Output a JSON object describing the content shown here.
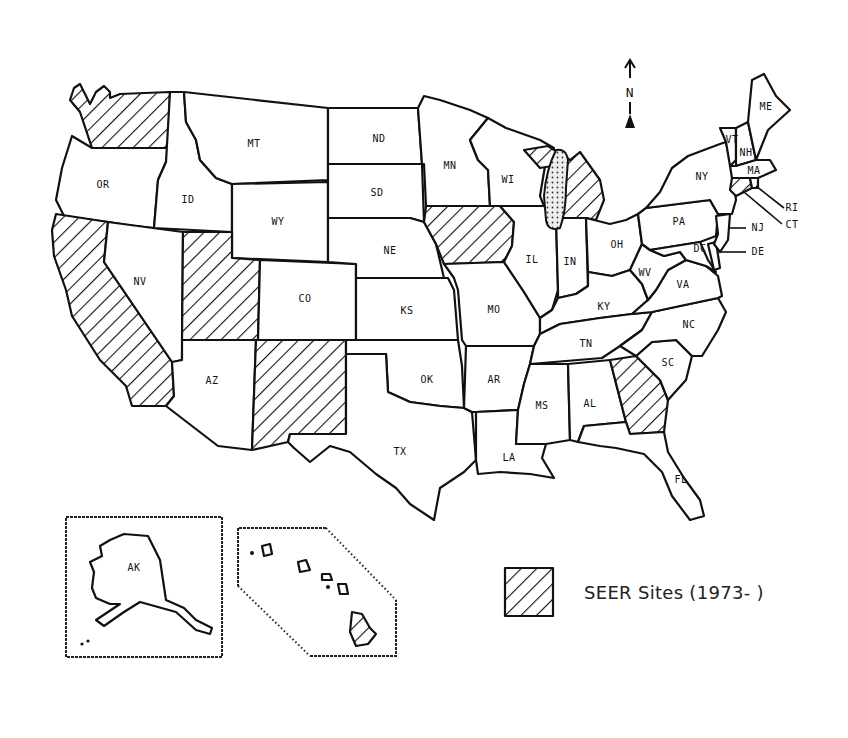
{
  "map": {
    "title": "",
    "legend": {
      "swatch_pattern": "diagonal-hatch",
      "label": "SEER Sites (1973-     )"
    },
    "compass": {
      "arrow": "↑",
      "letter": "N"
    },
    "seer_states": [
      "WA",
      "CA",
      "UT",
      "NM",
      "IA",
      "MI",
      "GA",
      "CT",
      "HI"
    ],
    "states": {
      "WA": "",
      "OR": "OR",
      "CA": "",
      "NV": "NV",
      "ID": "ID",
      "MT": "MT",
      "WY": "WY",
      "UT": "",
      "AZ": "AZ",
      "CO": "CO",
      "NM": "",
      "ND": "ND",
      "SD": "SD",
      "NE": "NE",
      "KS": "KS",
      "OK": "OK",
      "TX": "TX",
      "MN": "MN",
      "IA": "",
      "MO": "MO",
      "AR": "AR",
      "LA": "LA",
      "WI": "WI",
      "IL": "IL",
      "MI": "",
      "IN": "IN",
      "OH": "OH",
      "KY": "KY",
      "TN": "TN",
      "MS": "MS",
      "AL": "AL",
      "GA": "",
      "FL": "FL",
      "SC": "SC",
      "NC": "NC",
      "VA": "VA",
      "WV": "WV",
      "PA": "PA",
      "NY": "NY",
      "VT": "VT",
      "NH": "NH",
      "ME": "ME",
      "MA": "MA",
      "RI": "RI",
      "CT": "CT",
      "NJ": "NJ",
      "DE": "DE",
      "MD": "MD",
      "DC": "DC",
      "AK": "AK",
      "HI": ""
    },
    "insets": {
      "alaska_label": "AK"
    }
  }
}
